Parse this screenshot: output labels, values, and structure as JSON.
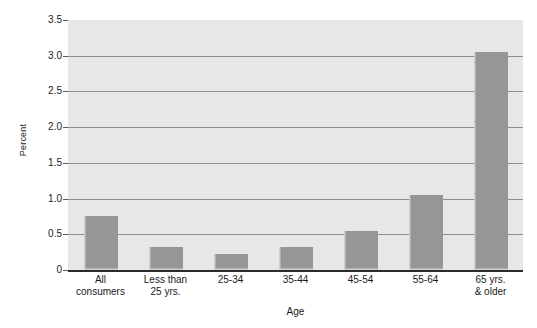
{
  "chart_data": {
    "type": "bar",
    "title": "",
    "xlabel": "Age",
    "ylabel": "Percent",
    "categories": [
      "All\nconsumers",
      "Less than\n25 yrs.",
      "25-34",
      "35-44",
      "45-54",
      "55-64",
      "65 yrs.\n& older"
    ],
    "values": [
      0.75,
      0.32,
      0.22,
      0.32,
      0.55,
      1.05,
      3.05
    ],
    "ylim": [
      0,
      3.5
    ],
    "yticks": [
      0,
      0.5,
      1.0,
      1.5,
      2.0,
      2.5,
      3.0,
      3.5
    ],
    "ytick_labels": [
      "0",
      "0.5",
      "1.0",
      "1.5",
      "2.0",
      "2.5",
      "3.0",
      "3.5"
    ],
    "grid": true,
    "gridlines_at": [
      0.5,
      1.0,
      1.5,
      2.0,
      2.5,
      3.0
    ],
    "legend": null,
    "legend_position": "none",
    "colors": {
      "bar_fill": "#969696",
      "plot_background": "#e7e7e7",
      "gridline": "#8e8e8e",
      "axis_line": "#2b2b2b",
      "text": "#1a1a1a",
      "page_background": "#ffffff"
    }
  }
}
